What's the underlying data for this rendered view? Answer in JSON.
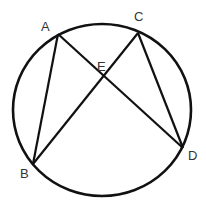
{
  "diagram": {
    "type": "circle-inscribed-chords",
    "stroke_color": "#111111",
    "label_color": "#333333",
    "circle": {
      "cx": 102,
      "cy": 110,
      "rx": 89,
      "ry": 86
    },
    "points": {
      "A": {
        "label": "A",
        "x": 58,
        "y": 34,
        "label_x": 41,
        "label_y": 31
      },
      "B": {
        "label": "B",
        "x": 33,
        "y": 164,
        "label_x": 20,
        "label_y": 178
      },
      "C": {
        "label": "C",
        "x": 138,
        "y": 33,
        "label_x": 134,
        "label_y": 21
      },
      "D": {
        "label": "D",
        "x": 183,
        "y": 148,
        "label_x": 188,
        "label_y": 160
      },
      "E": {
        "label": "E",
        "x": 102,
        "y": 80,
        "label_x": 97,
        "label_y": 71
      }
    },
    "segments": [
      "AB",
      "AD",
      "BC",
      "CD"
    ]
  }
}
